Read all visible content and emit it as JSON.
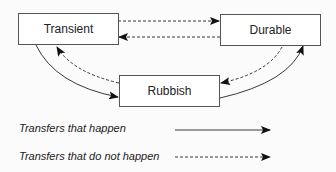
{
  "nodes": {
    "transient": {
      "label": "Transient"
    },
    "durable": {
      "label": "Durable"
    },
    "rubbish": {
      "label": "Rubbish"
    }
  },
  "edges": [
    {
      "from": "Transient",
      "to": "Durable",
      "style": "dashed"
    },
    {
      "from": "Durable",
      "to": "Transient",
      "style": "dashed"
    },
    {
      "from": "Transient",
      "to": "Rubbish",
      "style": "solid"
    },
    {
      "from": "Rubbish",
      "to": "Transient",
      "style": "dashed"
    },
    {
      "from": "Rubbish",
      "to": "Durable",
      "style": "solid"
    },
    {
      "from": "Durable",
      "to": "Rubbish",
      "style": "dashed"
    }
  ],
  "legend": {
    "happen": {
      "label": "Transfers that happen",
      "style": "solid"
    },
    "not_happen": {
      "label": "Transfers that do not happen",
      "style": "dashed"
    }
  }
}
